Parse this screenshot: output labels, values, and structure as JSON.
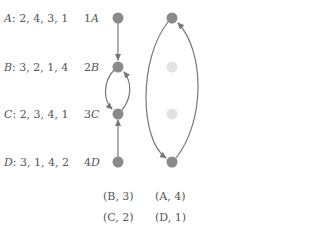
{
  "preferences": [
    {
      "name": "A",
      "list": "2, 4, 3, 1"
    },
    {
      "name": "B",
      "list": "3, 2, 1, 4"
    },
    {
      "name": "C",
      "list": "2, 3, 4, 1"
    },
    {
      "name": "D",
      "list": "3, 1, 4, 2"
    }
  ],
  "node_labels": [
    {
      "num": "1",
      "letter": "A"
    },
    {
      "num": "2",
      "letter": "B"
    },
    {
      "num": "3",
      "letter": "C"
    },
    {
      "num": "4",
      "letter": "D"
    }
  ],
  "pairs_left": [
    "(B, 3)",
    "(C, 2)"
  ],
  "pairs_right": [
    "(A, 4)",
    "(D, 1)"
  ],
  "colors": {
    "node": "#8a8a8a",
    "node_faded": "#e2e2e2",
    "edge": "#777777"
  }
}
